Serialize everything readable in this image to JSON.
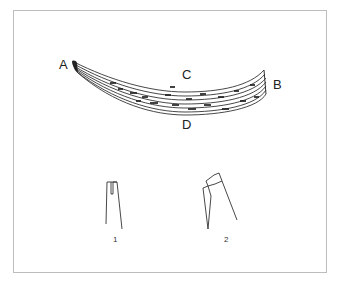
{
  "diagram": {
    "labels": {
      "a": "A",
      "b": "B",
      "c": "C",
      "d": "D"
    },
    "detail_figures": [
      {
        "number": "1",
        "description": "slotted end detail"
      },
      {
        "number": "2",
        "description": "capped end detail"
      }
    ],
    "colors": {
      "border": "#bdbdbd",
      "ink": "#222222",
      "background": "#ffffff"
    }
  }
}
